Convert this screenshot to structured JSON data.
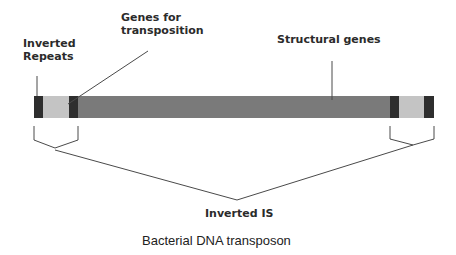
{
  "diagram": {
    "title": "Bacterial DNA transposon",
    "labels": {
      "inverted_repeats": [
        "Inverted",
        "Repeats"
      ],
      "genes_for_transposition": [
        "Genes for",
        "transposition"
      ],
      "structural_genes": "Structural genes",
      "inverted_is": "Inverted IS"
    },
    "colors": {
      "dark_segment": "#2e2e2e",
      "light_segment": "#c4c4c4",
      "structural_segment": "#7a7a7a",
      "line": "#4a4a4a"
    },
    "segments": [
      {
        "name": "inverted-repeat-left-outer",
        "type": "dark"
      },
      {
        "name": "transposition-genes-left",
        "type": "light"
      },
      {
        "name": "inverted-repeat-left-inner",
        "type": "dark"
      },
      {
        "name": "structural-genes",
        "type": "structural"
      },
      {
        "name": "inverted-repeat-right-inner",
        "type": "dark"
      },
      {
        "name": "transposition-genes-right",
        "type": "light"
      },
      {
        "name": "inverted-repeat-right-outer",
        "type": "dark"
      }
    ]
  }
}
